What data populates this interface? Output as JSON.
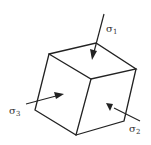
{
  "diagram": {
    "labels": {
      "sigma1": {
        "symbol": "σ",
        "subscript": "1"
      },
      "sigma2": {
        "symbol": "σ",
        "subscript": "2"
      },
      "sigma3": {
        "symbol": "σ",
        "subscript": "3"
      }
    },
    "colors": {
      "line": "#222222",
      "text": "#333333",
      "background": "#ffffff"
    }
  }
}
